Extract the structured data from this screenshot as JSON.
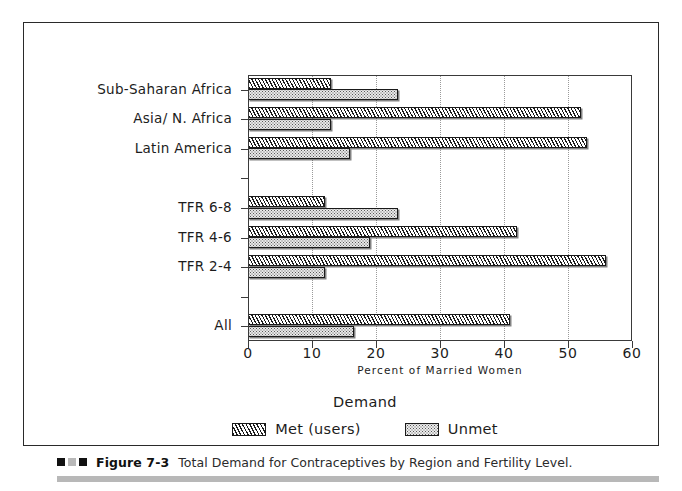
{
  "figure": {
    "caption_marks": [
      "dark",
      "mid",
      "dark"
    ],
    "caption_number": "Figure 7-3",
    "caption_text": "Total Demand for Contraceptives by Region and Fertility Level."
  },
  "chart_data": {
    "type": "bar",
    "orientation": "horizontal",
    "title": "",
    "xlabel": "Percent of Married Women",
    "ylabel": "",
    "xlim": [
      0,
      60
    ],
    "xticks": [
      0,
      10,
      20,
      30,
      40,
      50,
      60
    ],
    "xtick_labels": [
      "0",
      "10",
      "20",
      "30",
      "40",
      "50",
      "60"
    ],
    "grid": "vertical-dotted",
    "legend_title": "Demand",
    "legend_position": "below-axes-center",
    "categories": [
      "Sub-Saharan Africa",
      "Asia/ N. Africa",
      "Latin America",
      "",
      "TFR 6-8",
      "TFR 4-6",
      "TFR 2-4",
      "",
      "All"
    ],
    "series": [
      {
        "name": "Met (users)",
        "pattern": "diagonal-hatch",
        "values": [
          13,
          52,
          53,
          null,
          12,
          42,
          56,
          null,
          41
        ]
      },
      {
        "name": "Unmet",
        "pattern": "dotted-fill",
        "values": [
          23.5,
          13,
          16,
          null,
          23.5,
          19,
          12,
          null,
          16.5
        ]
      }
    ],
    "colors": {
      "met_fill": "#ffffff",
      "met_hatch": "#1a1a1a",
      "unmet_fill": "#e8e8e8",
      "unmet_dots": "#5a5a5a",
      "axis": "#3a3a3a",
      "grid": "#9a9a9a"
    }
  }
}
